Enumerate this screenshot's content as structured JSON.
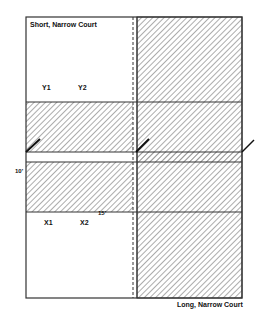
{
  "diagram": {
    "title_top": "Short, Narrow Court",
    "title_bottom": "Long, Narrow Court",
    "labels": {
      "y1": "Y1",
      "y2": "Y2",
      "x1": "X1",
      "x2": "X2",
      "dim_10": "10'",
      "dim_15": "15'"
    },
    "colors": {
      "line": "#333333",
      "hatch": "#555555",
      "background": "#ffffff"
    }
  }
}
